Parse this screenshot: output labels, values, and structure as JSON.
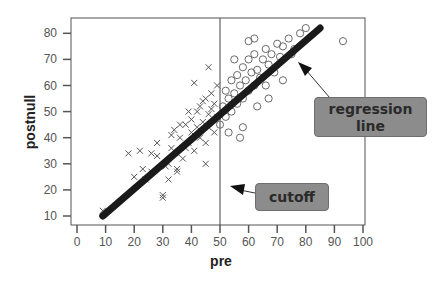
{
  "chart_data": {
    "type": "scatter",
    "title": "",
    "xlabel": "pre",
    "ylabel": "postnull",
    "xlim": [
      0,
      100
    ],
    "ylim": [
      10,
      80
    ],
    "x_ticks": [
      0,
      10,
      20,
      30,
      40,
      50,
      60,
      70,
      80,
      90,
      100
    ],
    "y_ticks": [
      10,
      20,
      30,
      40,
      50,
      60,
      70,
      80
    ],
    "grid": false,
    "legend": null,
    "series": [
      {
        "name": "below cutoff (pre < 50)",
        "marker": "x",
        "points": [
          [
            9,
            12
          ],
          [
            18,
            34
          ],
          [
            22,
            35
          ],
          [
            23,
            28
          ],
          [
            24,
            24
          ],
          [
            26,
            27
          ],
          [
            28,
            33
          ],
          [
            28,
            38
          ],
          [
            30,
            18
          ],
          [
            30,
            17
          ],
          [
            31,
            29
          ],
          [
            32,
            30
          ],
          [
            33,
            36
          ],
          [
            33,
            41
          ],
          [
            34,
            43
          ],
          [
            35,
            34
          ],
          [
            35,
            28
          ],
          [
            36,
            40
          ],
          [
            37,
            32
          ],
          [
            38,
            36
          ],
          [
            38,
            45
          ],
          [
            39,
            38
          ],
          [
            40,
            42
          ],
          [
            40,
            47
          ],
          [
            41,
            35
          ],
          [
            42,
            44
          ],
          [
            42,
            50
          ],
          [
            43,
            40
          ],
          [
            43,
            52
          ],
          [
            44,
            46
          ],
          [
            45,
            38
          ],
          [
            45,
            55
          ],
          [
            46,
            49
          ],
          [
            46,
            44
          ],
          [
            47,
            51
          ],
          [
            47,
            57
          ],
          [
            48,
            42
          ],
          [
            48,
            53
          ],
          [
            49,
            48
          ],
          [
            49,
            60
          ],
          [
            41,
            61
          ],
          [
            46,
            67
          ],
          [
            44,
            54
          ],
          [
            39,
            50
          ],
          [
            36,
            45
          ],
          [
            45,
            30
          ],
          [
            20,
            25
          ],
          [
            26,
            34
          ],
          [
            32,
            24
          ],
          [
            35,
            27
          ]
        ]
      },
      {
        "name": "above cutoff (pre >= 50)",
        "marker": "o",
        "points": [
          [
            50,
            45
          ],
          [
            51,
            52
          ],
          [
            52,
            48
          ],
          [
            52,
            58
          ],
          [
            53,
            55
          ],
          [
            54,
            50
          ],
          [
            54,
            62
          ],
          [
            55,
            57
          ],
          [
            56,
            53
          ],
          [
            56,
            64
          ],
          [
            57,
            60
          ],
          [
            58,
            55
          ],
          [
            58,
            67
          ],
          [
            59,
            62
          ],
          [
            60,
            58
          ],
          [
            60,
            70
          ],
          [
            61,
            65
          ],
          [
            62,
            60
          ],
          [
            62,
            72
          ],
          [
            63,
            66
          ],
          [
            64,
            63
          ],
          [
            65,
            70
          ],
          [
            66,
            74
          ],
          [
            67,
            68
          ],
          [
            68,
            72
          ],
          [
            69,
            65
          ],
          [
            70,
            76
          ],
          [
            71,
            71
          ],
          [
            72,
            75
          ],
          [
            74,
            78
          ],
          [
            76,
            74
          ],
          [
            78,
            80
          ],
          [
            80,
            82
          ],
          [
            60,
            77
          ],
          [
            62,
            78
          ],
          [
            57,
            40
          ],
          [
            58,
            44
          ],
          [
            53,
            42
          ],
          [
            67,
            55
          ],
          [
            72,
            62
          ],
          [
            93,
            77
          ],
          [
            55,
            70
          ],
          [
            63,
            52
          ],
          [
            66,
            60
          ],
          [
            75,
            72
          ]
        ]
      },
      {
        "name": "regression line",
        "type": "line",
        "points": [
          [
            9,
            10
          ],
          [
            85,
            82
          ]
        ]
      }
    ],
    "annotations": [
      {
        "text": "regression line",
        "type": "callout",
        "arrow_to": [
          79,
          68
        ]
      },
      {
        "text": "cutoff",
        "type": "callout",
        "arrow_to": [
          54,
          25
        ],
        "describes": "vertical line at pre = 50"
      }
    ],
    "reference_lines": [
      {
        "axis": "x",
        "value": 50,
        "label": "cutoff"
      }
    ]
  },
  "labels": {
    "x_axis_title": "pre",
    "y_axis_title": "postnull",
    "callout_regression": "regression line",
    "callout_regression_line1": "regression",
    "callout_regression_line2": "line",
    "callout_cutoff": "cutoff"
  },
  "colors": {
    "points": "#555555",
    "regression_line": "#1a1a1a",
    "callout_fill": "#8c8c8c",
    "axis": "#555555"
  }
}
